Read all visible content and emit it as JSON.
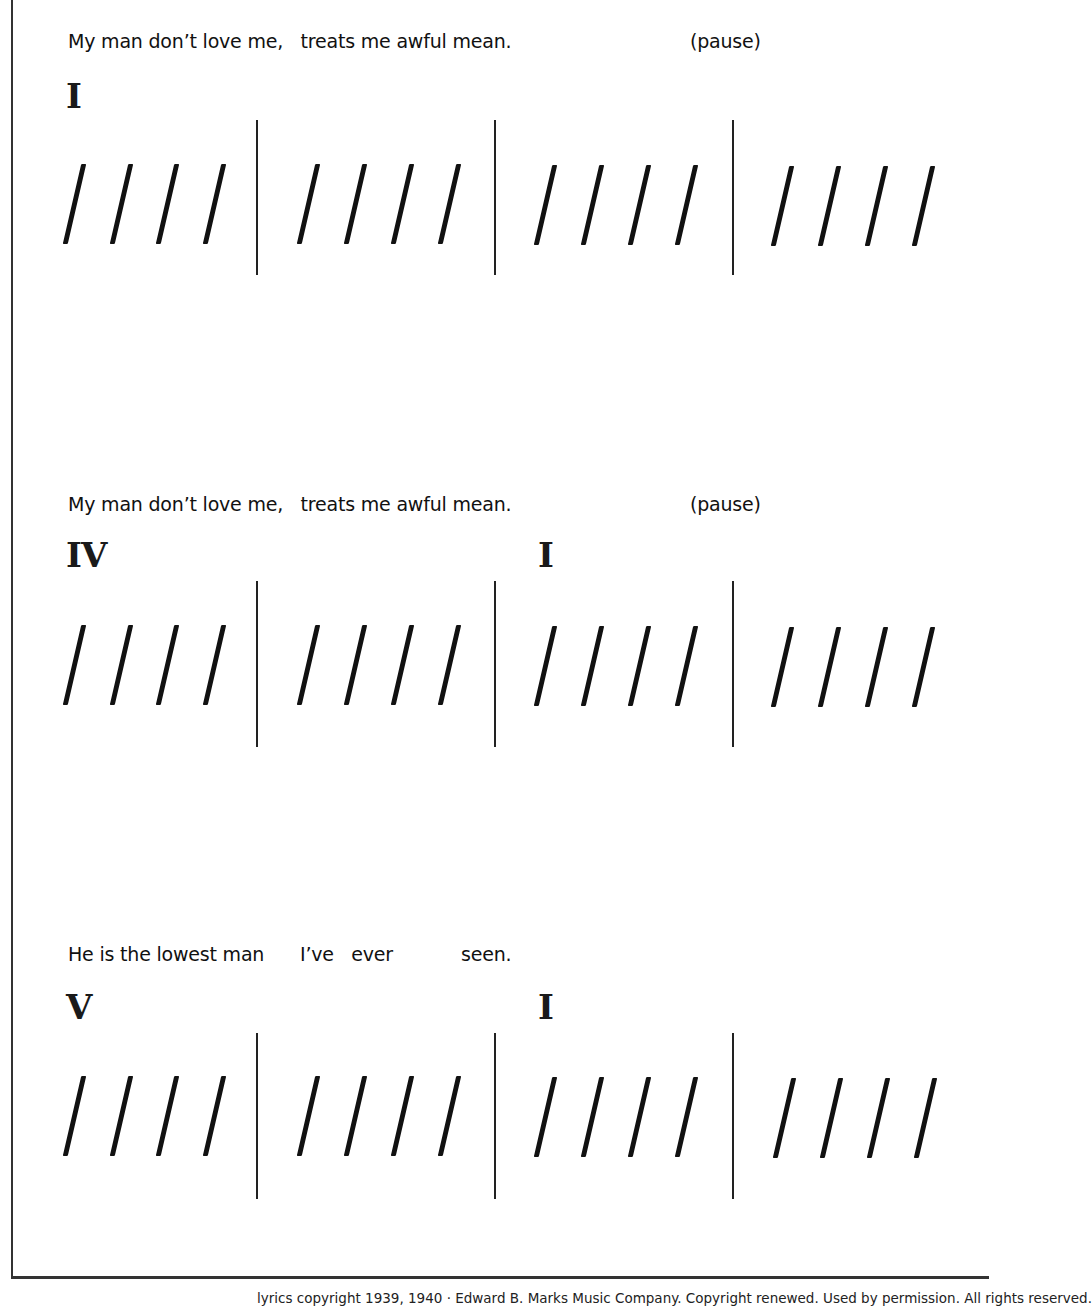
{
  "systems": [
    {
      "lyrics": [
        {
          "text": "My man don’t love me,   treats me awful mean.",
          "x": 68
        },
        {
          "text": "(pause)",
          "x": 690
        }
      ],
      "chords": [
        {
          "label": "I",
          "measure": 1
        }
      ],
      "measures": [
        {
          "beats": 4
        },
        {
          "beats": 4
        },
        {
          "beats": 4
        },
        {
          "beats": 4
        }
      ]
    },
    {
      "lyrics": [
        {
          "text": "My man don’t love me,   treats me awful mean.",
          "x": 68
        },
        {
          "text": "(pause)",
          "x": 690
        }
      ],
      "chords": [
        {
          "label": "IV",
          "measure": 1
        },
        {
          "label": "I",
          "measure": 3
        }
      ],
      "measures": [
        {
          "beats": 4
        },
        {
          "beats": 4
        },
        {
          "beats": 4
        },
        {
          "beats": 4
        }
      ]
    },
    {
      "lyrics": [
        {
          "text": "He is the lowest man",
          "x": 68
        },
        {
          "text": "I’ve   ever",
          "x": 300
        },
        {
          "text": "seen.",
          "x": 461
        }
      ],
      "chords": [
        {
          "label": "V",
          "measure": 1
        },
        {
          "label": "I",
          "measure": 3
        }
      ],
      "measures": [
        {
          "beats": 4
        },
        {
          "beats": 4
        },
        {
          "beats": 4
        },
        {
          "beats": 4
        }
      ]
    }
  ],
  "footer": {
    "copyright": "lyrics copyright 1939, 1940 · Edward B. Marks Music Company. Copyright renewed. Used by permission. All rights reserved."
  }
}
